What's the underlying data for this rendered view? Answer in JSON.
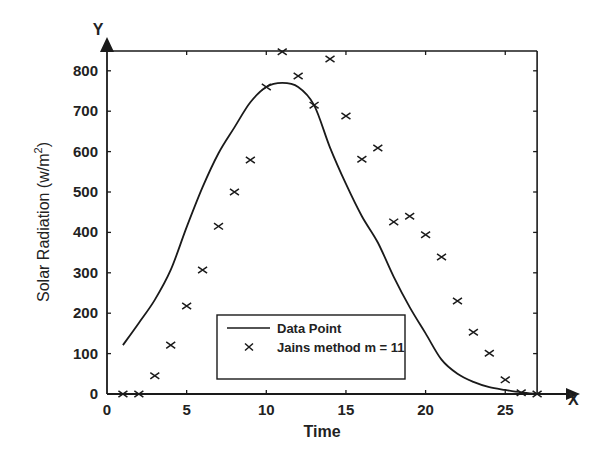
{
  "chart_data": {
    "type": "line",
    "title": "",
    "xlabel": "Time",
    "ylabel": "Solar Radiation (w/m²)",
    "ylabel_parts": {
      "main": "Solar Radiation (w/m",
      "sup": "2",
      "close": ")"
    },
    "axis_arrows": {
      "x": "X",
      "y": "Y"
    },
    "xlim": [
      0,
      27
    ],
    "ylim": [
      0,
      850
    ],
    "x_ticks": [
      0,
      5,
      10,
      15,
      20,
      25
    ],
    "y_ticks": [
      0,
      100,
      200,
      300,
      400,
      500,
      600,
      700,
      800
    ],
    "grid": false,
    "legend_position": "lower center",
    "x": [
      1,
      2,
      3,
      4,
      5,
      6,
      7,
      8,
      9,
      10,
      11,
      12,
      13,
      14,
      15,
      16,
      17,
      18,
      19,
      20,
      21,
      22,
      23,
      24,
      25,
      26,
      27
    ],
    "series": [
      {
        "name": "Data Point",
        "style": "line",
        "values": [
          121,
          176,
          233,
          307,
          413,
          512,
          596,
          660,
          722,
          760,
          770,
          760,
          715,
          610,
          520,
          440,
          375,
          290,
          215,
          150,
          85,
          50,
          30,
          17,
          10,
          4,
          0
        ]
      },
      {
        "name": "Jains method m = 11",
        "style": "marker-x",
        "values": [
          0,
          0,
          45,
          121,
          218,
          307,
          415,
          500,
          579,
          760,
          847,
          787,
          715,
          829,
          688,
          581,
          609,
          426,
          440,
          394,
          339,
          230,
          153,
          101,
          35,
          3,
          0
        ]
      }
    ]
  }
}
